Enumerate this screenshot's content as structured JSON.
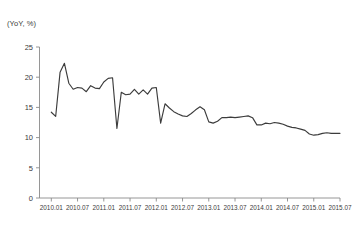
{
  "chart_data": {
    "type": "line",
    "title": "",
    "subtitle": "",
    "unit_label": "(YoY, %)",
    "xlabel": "",
    "ylabel": "",
    "ylim": [
      0,
      25
    ],
    "yticks": [
      0,
      5,
      10,
      15,
      20,
      25
    ],
    "xticks": [
      "2010.01",
      "2010.07",
      "2011.01",
      "2011.07",
      "2012.01",
      "2012.07",
      "2013.01",
      "2013.07",
      "2014.01",
      "2014.07",
      "2015.01",
      "2015.07"
    ],
    "grid": false,
    "legend": "none",
    "line_color": "#3c3c3c",
    "axis_color": "#8a8a8a",
    "x": [
      "2010.01",
      "2010.02",
      "2010.03",
      "2010.04",
      "2010.05",
      "2010.06",
      "2010.07",
      "2010.08",
      "2010.09",
      "2010.10",
      "2010.11",
      "2010.12",
      "2011.01",
      "2011.02",
      "2011.03",
      "2011.04",
      "2011.05",
      "2011.06",
      "2011.07",
      "2011.08",
      "2011.09",
      "2011.10",
      "2011.11",
      "2011.12",
      "2012.01",
      "2012.02",
      "2012.03",
      "2012.04",
      "2012.05",
      "2012.06",
      "2012.07",
      "2012.08",
      "2012.09",
      "2012.10",
      "2012.11",
      "2012.12",
      "2013.01",
      "2013.02",
      "2013.03",
      "2013.04",
      "2013.05",
      "2013.06",
      "2013.07",
      "2013.08",
      "2013.09",
      "2013.10",
      "2013.11",
      "2013.12",
      "2014.01",
      "2014.02",
      "2014.03",
      "2014.04",
      "2014.05",
      "2014.06",
      "2014.07",
      "2014.08",
      "2014.09",
      "2014.10",
      "2014.11",
      "2014.12",
      "2015.01",
      "2015.02",
      "2015.03",
      "2015.04",
      "2015.05",
      "2015.06",
      "2015.07"
    ],
    "values": [
      14.2,
      13.5,
      20.8,
      22.3,
      19.0,
      18.0,
      18.3,
      18.2,
      17.6,
      18.6,
      18.2,
      18.1,
      19.2,
      19.8,
      19.9,
      11.5,
      17.5,
      17.1,
      17.2,
      18.0,
      17.2,
      17.9,
      17.2,
      18.2,
      18.3,
      12.4,
      15.6,
      14.9,
      14.3,
      13.9,
      13.6,
      13.5,
      14.0,
      14.6,
      15.1,
      14.6,
      12.6,
      12.4,
      12.7,
      13.3,
      13.3,
      13.4,
      13.3,
      13.4,
      13.5,
      13.6,
      13.3,
      12.1,
      12.1,
      12.4,
      12.3,
      12.5,
      12.4,
      12.2,
      11.9,
      11.7,
      11.6,
      11.4,
      11.2,
      10.6,
      10.4,
      10.5,
      10.7,
      10.8,
      10.7,
      10.7,
      10.7
    ],
    "series": [
      {
        "name": "series-1",
        "values": [
          14.2,
          13.5,
          20.8,
          22.3,
          19.0,
          18.0,
          18.3,
          18.2,
          17.6,
          18.6,
          18.2,
          18.1,
          19.2,
          19.8,
          19.9,
          11.5,
          17.5,
          17.1,
          17.2,
          18.0,
          17.2,
          17.9,
          17.2,
          18.2,
          18.3,
          12.4,
          15.6,
          14.9,
          14.3,
          13.9,
          13.6,
          13.5,
          14.0,
          14.6,
          15.1,
          14.6,
          12.6,
          12.4,
          12.7,
          13.3,
          13.3,
          13.4,
          13.3,
          13.4,
          13.5,
          13.6,
          13.3,
          12.1,
          12.1,
          12.4,
          12.3,
          12.5,
          12.4,
          12.2,
          11.9,
          11.7,
          11.6,
          11.4,
          11.2,
          10.6,
          10.4,
          10.5,
          10.7,
          10.8,
          10.7,
          10.7,
          10.7
        ]
      }
    ]
  }
}
